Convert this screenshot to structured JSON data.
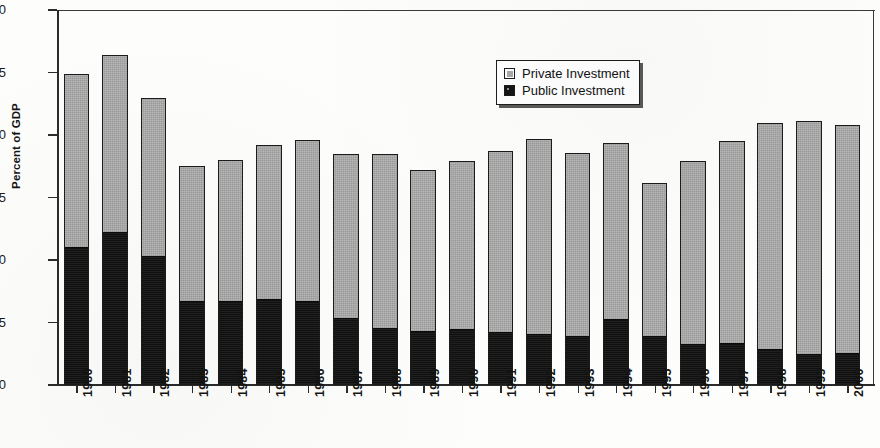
{
  "chart_data": {
    "type": "bar",
    "subtype": "stacked-bar",
    "title": "",
    "xlabel": "",
    "ylabel": "Percent of GDP",
    "ylim": [
      0,
      30
    ],
    "yticks": [
      0,
      5,
      10,
      15,
      20,
      25,
      30
    ],
    "grid": false,
    "legend_position": "top-center-right",
    "categories": [
      "1980",
      "1981",
      "1982",
      "1983",
      "1984",
      "1985",
      "1986",
      "1987",
      "1988",
      "1989",
      "1990",
      "1991",
      "1992",
      "1993",
      "1994",
      "1995",
      "1996",
      "1997",
      "1998",
      "1999",
      "2000"
    ],
    "series": [
      {
        "name": "Public Investment",
        "color": "#141414",
        "values": [
          10.9,
          12.1,
          10.2,
          6.6,
          6.6,
          6.7,
          6.6,
          5.2,
          4.4,
          4.2,
          4.3,
          4.1,
          3.9,
          3.8,
          5.1,
          3.8,
          3.1,
          3.2,
          2.7,
          2.3,
          2.4
        ]
      },
      {
        "name": "Private Investment",
        "color": "#a9a9a9",
        "values": [
          14.0,
          14.3,
          12.8,
          10.9,
          11.4,
          12.5,
          13.0,
          13.3,
          14.1,
          13.0,
          13.6,
          14.6,
          15.8,
          14.8,
          14.3,
          12.4,
          14.8,
          16.3,
          18.3,
          18.8,
          18.4
        ]
      }
    ],
    "totals": [
      24.9,
      26.4,
      23.0,
      17.5,
      18.0,
      19.2,
      19.6,
      18.5,
      18.5,
      17.2,
      17.9,
      18.7,
      19.7,
      18.6,
      19.4,
      16.2,
      17.9,
      19.5,
      21.0,
      21.1,
      20.8
    ]
  },
  "legend": {
    "items": [
      {
        "label": "Private Investment",
        "swatch": "gray-square-icon"
      },
      {
        "label": "Public Investment",
        "swatch": "black-square-icon"
      }
    ]
  },
  "axis": {
    "y_label": "Percent of GDP"
  }
}
